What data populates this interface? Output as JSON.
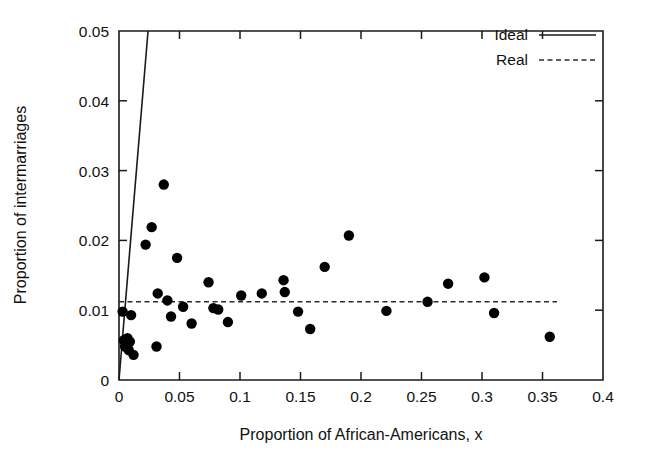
{
  "chart_data": {
    "type": "scatter",
    "title": "",
    "xlabel": "Proportion of African-Americans, x",
    "ylabel": "Proportion of intermarriages",
    "xlim": [
      0,
      0.4
    ],
    "ylim": [
      0,
      0.05
    ],
    "xticks": [
      0,
      0.05,
      0.1,
      0.15,
      0.2,
      0.25,
      0.3,
      0.35,
      0.4
    ],
    "xtick_labels": [
      "0",
      "0.05",
      "0.1",
      "0.15",
      "0.2",
      "0.25",
      "0.3",
      "0.35",
      "0.4"
    ],
    "yticks": [
      0,
      0.01,
      0.02,
      0.03,
      0.04,
      0.05
    ],
    "ytick_labels": [
      "0",
      "0.01",
      "0.02",
      "0.03",
      "0.04",
      "0.05"
    ],
    "grid": false,
    "legend_position": "top-right",
    "legend": [
      {
        "label": "Ideal",
        "style": "solid"
      },
      {
        "label": "Real",
        "style": "dashed"
      }
    ],
    "series": [
      {
        "name": "Ideal",
        "type": "line",
        "style": "solid",
        "points": [
          {
            "x": 0.0,
            "y": 0.0
          },
          {
            "x": 0.024,
            "y": 0.05
          }
        ]
      },
      {
        "name": "Real",
        "type": "line",
        "style": "dashed",
        "points": [
          {
            "x": 0.0,
            "y": 0.0112
          },
          {
            "x": 0.362,
            "y": 0.0112
          }
        ]
      },
      {
        "name": "States",
        "type": "scatter",
        "marker": "filled-circle",
        "points": [
          {
            "x": 0.003,
            "y": 0.0098
          },
          {
            "x": 0.004,
            "y": 0.0057
          },
          {
            "x": 0.005,
            "y": 0.0048
          },
          {
            "x": 0.006,
            "y": 0.0052
          },
          {
            "x": 0.007,
            "y": 0.006
          },
          {
            "x": 0.008,
            "y": 0.0043
          },
          {
            "x": 0.009,
            "y": 0.0055
          },
          {
            "x": 0.01,
            "y": 0.0093
          },
          {
            "x": 0.012,
            "y": 0.0036
          },
          {
            "x": 0.022,
            "y": 0.0194
          },
          {
            "x": 0.027,
            "y": 0.0219
          },
          {
            "x": 0.031,
            "y": 0.0048
          },
          {
            "x": 0.032,
            "y": 0.0124
          },
          {
            "x": 0.037,
            "y": 0.028
          },
          {
            "x": 0.04,
            "y": 0.0114
          },
          {
            "x": 0.043,
            "y": 0.0091
          },
          {
            "x": 0.048,
            "y": 0.0175
          },
          {
            "x": 0.053,
            "y": 0.0105
          },
          {
            "x": 0.06,
            "y": 0.0081
          },
          {
            "x": 0.074,
            "y": 0.014
          },
          {
            "x": 0.078,
            "y": 0.0103
          },
          {
            "x": 0.082,
            "y": 0.0101
          },
          {
            "x": 0.09,
            "y": 0.0083
          },
          {
            "x": 0.101,
            "y": 0.0121
          },
          {
            "x": 0.118,
            "y": 0.0124
          },
          {
            "x": 0.136,
            "y": 0.0143
          },
          {
            "x": 0.137,
            "y": 0.0126
          },
          {
            "x": 0.148,
            "y": 0.0098
          },
          {
            "x": 0.158,
            "y": 0.0073
          },
          {
            "x": 0.17,
            "y": 0.0162
          },
          {
            "x": 0.19,
            "y": 0.0207
          },
          {
            "x": 0.221,
            "y": 0.0099
          },
          {
            "x": 0.255,
            "y": 0.0112
          },
          {
            "x": 0.272,
            "y": 0.0138
          },
          {
            "x": 0.302,
            "y": 0.0147
          },
          {
            "x": 0.31,
            "y": 0.0096
          },
          {
            "x": 0.356,
            "y": 0.0062
          }
        ]
      }
    ]
  }
}
